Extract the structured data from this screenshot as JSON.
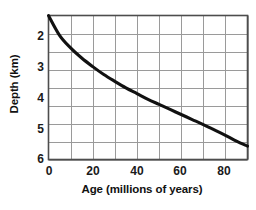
{
  "chart_data": {
    "type": "line",
    "title": "",
    "xlabel": "Age (millions of years)",
    "ylabel": "Depth (km)",
    "xlim": [
      0,
      90
    ],
    "ylim": [
      2,
      6
    ],
    "y_inverted": true,
    "grid": true,
    "x_major_ticks": [
      0,
      20,
      40,
      60,
      80
    ],
    "x_tick_labels": [
      "0",
      "20",
      "40",
      "60",
      "80"
    ],
    "x_gridline_step": 10,
    "y_major_ticks": [
      2,
      3,
      4,
      5,
      6
    ],
    "y_tick_labels": [
      "2",
      "3",
      "4",
      "5",
      "6"
    ],
    "y_gridline_step": 0.5,
    "legend": null,
    "series": [
      {
        "name": "Ocean floor depth",
        "x": [
          0,
          2,
          5,
          10,
          15,
          20,
          25,
          30,
          35,
          40,
          45,
          50,
          55,
          60,
          65,
          70,
          75,
          80,
          85,
          90
        ],
        "y": [
          2.0,
          2.27,
          2.52,
          2.84,
          3.08,
          3.28,
          3.45,
          3.61,
          3.75,
          3.88,
          4.0,
          4.11,
          4.22,
          4.32,
          4.42,
          4.51,
          4.6,
          4.68,
          4.76,
          4.84
        ]
      }
    ],
    "curve_points": [
      {
        "age": 0,
        "depth": 2.0
      },
      {
        "age": 5,
        "depth": 2.55
      },
      {
        "age": 10,
        "depth": 2.9
      },
      {
        "age": 15,
        "depth": 3.18
      },
      {
        "age": 20,
        "depth": 3.42
      },
      {
        "age": 25,
        "depth": 3.64
      },
      {
        "age": 30,
        "depth": 3.83
      },
      {
        "age": 35,
        "depth": 4.01
      },
      {
        "age": 40,
        "depth": 4.17
      },
      {
        "age": 45,
        "depth": 4.33
      },
      {
        "age": 50,
        "depth": 4.47
      },
      {
        "age": 55,
        "depth": 4.61
      },
      {
        "age": 60,
        "depth": 4.75
      },
      {
        "age": 65,
        "depth": 4.89
      },
      {
        "age": 70,
        "depth": 5.03
      },
      {
        "age": 75,
        "depth": 5.18
      },
      {
        "age": 80,
        "depth": 5.33
      },
      {
        "age": 85,
        "depth": 5.49
      },
      {
        "age": 90,
        "depth": 5.63
      }
    ],
    "colors": {
      "curve": "#111111",
      "grid": "#9a9a9a",
      "frame": "#4d4d4d",
      "text": "#111111",
      "background": "#ffffff"
    }
  }
}
